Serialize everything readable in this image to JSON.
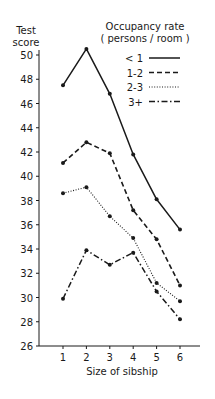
{
  "chart_data": {
    "type": "line",
    "title": "",
    "ylabel": "Test score",
    "ylabel_lines": [
      "Test",
      "score"
    ],
    "xlabel": "Size of sibship",
    "x": [
      1,
      2,
      3,
      4,
      5,
      6
    ],
    "categories": [
      "1",
      "2",
      "3",
      "4",
      "5",
      "6"
    ],
    "ylim": [
      26,
      50
    ],
    "yticks": [
      26,
      28,
      30,
      32,
      34,
      36,
      38,
      40,
      42,
      44,
      46,
      48,
      50
    ],
    "grid": false,
    "legend_title": "Occupancy rate",
    "legend_subtitle": "( persons / room )",
    "legend_position": "upper right",
    "series": [
      {
        "name": "< 1",
        "style": "solid",
        "values": [
          47.5,
          50.5,
          46.8,
          41.8,
          38.1,
          35.6
        ]
      },
      {
        "name": "1-2",
        "style": "dashed",
        "values": [
          41.1,
          42.8,
          41.9,
          37.2,
          34.8,
          31.0
        ]
      },
      {
        "name": "2-3",
        "style": "dotted",
        "values": [
          38.6,
          39.1,
          36.7,
          34.9,
          31.2,
          29.7
        ]
      },
      {
        "name": "3+",
        "style": "dashdot",
        "values": [
          29.9,
          33.9,
          32.7,
          33.7,
          30.5,
          28.2
        ]
      }
    ]
  },
  "colors": {
    "ink": "#1a1a1a",
    "background": "#ffffff"
  }
}
